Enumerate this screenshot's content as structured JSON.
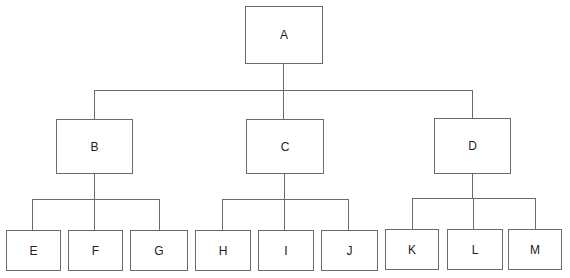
{
  "diagram": {
    "type": "tree",
    "line_color": "#6a6a6a",
    "root": {
      "label": "A"
    },
    "level1": [
      {
        "label": "B",
        "children": [
          "E",
          "F",
          "G"
        ]
      },
      {
        "label": "C",
        "children": [
          "H",
          "I",
          "J"
        ]
      },
      {
        "label": "D",
        "children": [
          "K",
          "L",
          "M"
        ]
      }
    ],
    "nodes": {
      "A": "A",
      "B": "B",
      "C": "C",
      "D": "D",
      "E": "E",
      "F": "F",
      "G": "G",
      "H": "H",
      "I": "I",
      "J": "J",
      "K": "K",
      "L": "L",
      "M": "M"
    }
  }
}
